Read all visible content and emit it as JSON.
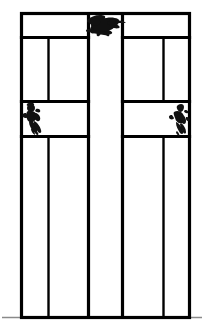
{
  "image": {
    "title": "Cruciform window elevation line drawing",
    "width": 204,
    "height": 330,
    "background_color": "#ffffff",
    "stroke_color": "#000000",
    "ground_line_color": "#888888"
  },
  "diagram": {
    "type": "line-drawing",
    "outer_frame": {
      "x": 21,
      "y": 13,
      "width": 169,
      "height": 305,
      "stroke_width": 3
    },
    "cross": {
      "vertical_beam": {
        "left": 88,
        "right": 122,
        "top": 13,
        "bottom": 318
      },
      "horizontal_beam": {
        "top": 101,
        "bottom": 136,
        "left": 21,
        "right": 190
      },
      "stroke_width": 3
    },
    "panels": {
      "upper_left_row": [
        "transom-panel-left"
      ],
      "upper_right_row": [
        "transom-panel-right"
      ],
      "mullion_columns_left": [
        48,
        88
      ],
      "mullion_columns_right": [
        122,
        163
      ],
      "outer_columns": [
        21,
        190
      ]
    },
    "horizontal_rails": [
      13,
      37,
      101,
      136,
      318
    ],
    "vertical_mullions": [
      21,
      48,
      88,
      122,
      163,
      190
    ],
    "ground_line": {
      "y": 317,
      "x1": 2,
      "x2": 202,
      "stroke_width": 1
    }
  },
  "figures": [
    {
      "name": "top-center-ink-figure",
      "label": "dark ink blot figure",
      "position": "top center transom panel",
      "x": 88,
      "y": 14,
      "width": 34,
      "height": 23,
      "color": "#111111"
    },
    {
      "name": "left-arm-ink-figure",
      "label": "dark ink blot figure",
      "position": "left cross arm",
      "x": 24,
      "y": 102,
      "width": 20,
      "height": 33,
      "color": "#111111"
    },
    {
      "name": "right-arm-ink-figure",
      "label": "dark ink blot figure",
      "position": "right cross arm",
      "x": 168,
      "y": 102,
      "width": 20,
      "height": 33,
      "color": "#111111"
    }
  ]
}
